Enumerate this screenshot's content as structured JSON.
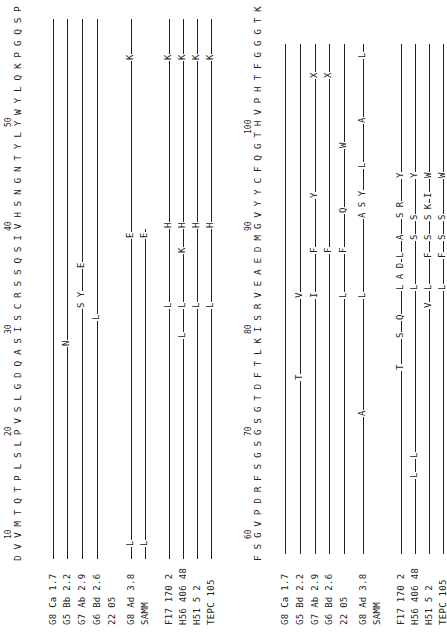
{
  "figure": {
    "panel_a": {
      "sequence": "D V V M T Q T P L S L P V S L G D Q A S I S C R S S Q S I V H S N G N T Y L Y W Y L Q K P G Q S P K L L I Y R V S N R",
      "position_labels": [
        "10",
        "20",
        "30",
        "40",
        "50"
      ],
      "rows": [
        {
          "label": "G8 Ca 1.7",
          "substitutions": []
        },
        {
          "label": "G5 Bb 2.2",
          "substitutions": [
            "N"
          ]
        },
        {
          "label": "G7 Ab 2.9",
          "substitutions": [
            "S Y",
            "E"
          ]
        },
        {
          "label": "G6 Bd 2.6",
          "substitutions": [
            "L"
          ]
        },
        {
          "label": "22 05",
          "substitutions": []
        },
        {
          "label": "G8 Ad 3.8",
          "substitutions": [
            "L",
            "E",
            "K"
          ]
        },
        {
          "label": "SAMM",
          "substitutions": [
            "L",
            "E"
          ]
        },
        {
          "label": "F17 170 2",
          "substitutions": [
            "L",
            "H",
            "K"
          ]
        },
        {
          "label": "H56 406 48",
          "substitutions": [
            "L",
            "L",
            "K",
            "H",
            "K"
          ]
        },
        {
          "label": "H51 5 2",
          "substitutions": [
            "L",
            "H",
            "K"
          ]
        },
        {
          "label": "TEPC 105",
          "substitutions": [
            "L",
            "H",
            "K"
          ]
        }
      ]
    },
    "panel_b": {
      "sequence": "F S G V P D R F S G S G S G T D F T L K I S R V E A E D M G V Y Y C F Q G T H V P H T F G G G T K L E I K R",
      "position_labels": [
        "60",
        "70",
        "80",
        "90",
        "100"
      ],
      "rows": [
        {
          "label": "G8 Ca 1.7",
          "substitutions": []
        },
        {
          "label": "G5 Bd 2.2",
          "substitutions": [
            "T",
            "V"
          ]
        },
        {
          "label": "G7 Ab 2.9",
          "substitutions": [
            "I",
            "F",
            "Y",
            "X"
          ]
        },
        {
          "label": "G6 Bd 2.6",
          "substitutions": [
            "F",
            "X"
          ]
        },
        {
          "label": "22 05",
          "substitutions": [
            "L",
            "F",
            "Q",
            "W"
          ]
        },
        {
          "label": "G8 Ad 3.8",
          "substitutions": [
            "A",
            "L",
            "A S Y",
            "L",
            "A",
            "L"
          ]
        },
        {
          "label": "SAMM",
          "substitutions": []
        },
        {
          "label": "F17 170 2",
          "substitutions": [
            "T",
            "S",
            "Q",
            "L A D",
            "L",
            "A",
            "S R",
            "Y"
          ]
        },
        {
          "label": "H56 406 48",
          "substitutions": [
            "L",
            "L",
            "L",
            "S",
            "S",
            "Y"
          ]
        },
        {
          "label": "H51 5 2",
          "substitutions": [
            "V",
            "L",
            "F",
            "S",
            "S K",
            "I",
            "W"
          ]
        },
        {
          "label": "TEPC 105",
          "substitutions": [
            "L",
            "F",
            "S",
            "S",
            "W"
          ]
        }
      ]
    }
  }
}
